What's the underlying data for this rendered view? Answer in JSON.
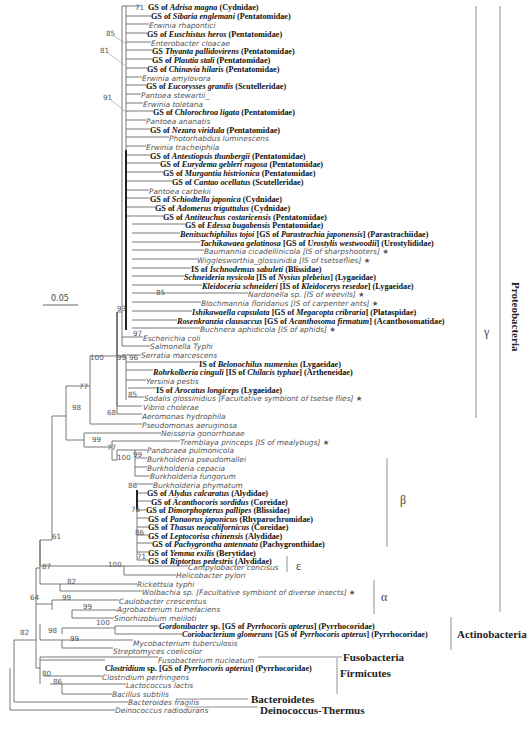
{
  "figure": {
    "scale_bar": "0.05",
    "groups": [
      {
        "id": "gamma",
        "label": "γ",
        "x": 484,
        "y": 325,
        "line": {
          "x": 476,
          "y1": 6,
          "y2": 418
        },
        "style": "greek"
      },
      {
        "id": "proteobacteria",
        "label": "Proteobacteria",
        "x": 510,
        "y": 282,
        "line": {
          "x": 500,
          "y1": 6,
          "y2": 612
        },
        "style": "vert"
      },
      {
        "id": "beta",
        "label": "β",
        "x": 400,
        "y": 493,
        "line": {
          "x": 387,
          "y1": 458,
          "y2": 547
        },
        "style": "greek"
      },
      {
        "id": "epsilon",
        "label": "ε",
        "x": 296,
        "y": 559,
        "line": {
          "x": 287,
          "y1": 556,
          "y2": 572
        },
        "style": "greek"
      },
      {
        "id": "alpha",
        "label": "α",
        "x": 381,
        "y": 590,
        "line": {
          "x": 374,
          "y1": 580,
          "y2": 614
        },
        "style": "greek"
      },
      {
        "id": "actinobacteria",
        "label": "Actinobacteria",
        "x": 457,
        "y": 628,
        "line": {
          "x": 451,
          "y1": 617,
          "y2": 650
        },
        "style": "big"
      },
      {
        "id": "fusobacteria",
        "label": "Fusobacteria",
        "x": 343,
        "y": 651,
        "style": "big"
      },
      {
        "id": "firmicutes",
        "label": "Firmicutes",
        "x": 340,
        "y": 667,
        "line": {
          "x": 337,
          "y1": 658,
          "y2": 694
        },
        "style": "big"
      },
      {
        "id": "bacteroidetes",
        "label": "Bacteroidetes",
        "x": 251,
        "y": 693,
        "style": "big"
      },
      {
        "id": "deinococcus",
        "label": "Deinococcus-Thermus",
        "x": 260,
        "y": 704,
        "style": "big"
      }
    ],
    "leaves": [
      {
        "t": "sym",
        "x": 148,
        "y": 4,
        "parts": [
          "GS of ",
          "Adrisa magna",
          " (Cydnidae)"
        ]
      },
      {
        "t": "sym",
        "x": 151,
        "y": 13,
        "parts": [
          "GS of ",
          "Sibaria englemani",
          " (Pentatomidae)"
        ]
      },
      {
        "t": "ref",
        "x": 149,
        "y": 22,
        "text": "Erwinia rhapontici"
      },
      {
        "t": "sym",
        "x": 147,
        "y": 31,
        "parts": [
          "GS of ",
          "Euschistus heros",
          " (Pentatomidae)"
        ]
      },
      {
        "t": "ref",
        "x": 151,
        "y": 40,
        "text": "Enterobacter cloacae"
      },
      {
        "t": "sym",
        "x": 152,
        "y": 48,
        "parts": [
          "GS ",
          "Thyanta pallidovirens",
          " (Pentatomidae)"
        ]
      },
      {
        "t": "sym",
        "x": 152,
        "y": 57,
        "parts": [
          "GS of ",
          "Plautia stali",
          " (Pentatomidae)"
        ]
      },
      {
        "t": "sym",
        "x": 147,
        "y": 66,
        "parts": [
          "GS of ",
          "Chinavia hilaris",
          " (Pentatomidae)"
        ]
      },
      {
        "t": "ref",
        "x": 142,
        "y": 75,
        "text": "Erwinia amylovora"
      },
      {
        "t": "sym",
        "x": 146,
        "y": 83,
        "parts": [
          "GS of ",
          "Eucorysses grandis",
          " (Scutelleridae)"
        ]
      },
      {
        "t": "ref",
        "x": 141,
        "y": 92,
        "text": "Pantoea stewartii_"
      },
      {
        "t": "ref",
        "x": 143,
        "y": 101,
        "text": "Erwinia toletana"
      },
      {
        "t": "sym",
        "x": 153,
        "y": 109,
        "parts": [
          "GS of ",
          "Chlorochroa ligata",
          " (Pentatomidae)"
        ]
      },
      {
        "t": "ref",
        "x": 146,
        "y": 118,
        "text": "Pantoea ananatis"
      },
      {
        "t": "sym",
        "x": 150,
        "y": 127,
        "parts": [
          "GS of ",
          "Nezara viridula",
          " (Pentatomidae)"
        ]
      },
      {
        "t": "ref",
        "x": 169,
        "y": 135,
        "text": "Photorhabdus luminescens"
      },
      {
        "t": "ref",
        "x": 146,
        "y": 144,
        "text": "Erwinia tracheiphila"
      },
      {
        "t": "sym",
        "x": 150,
        "y": 153,
        "parts": [
          "GS of ",
          "Antestiopsis thunbergii",
          " (Pentatomidae)"
        ]
      },
      {
        "t": "sym",
        "x": 160,
        "y": 161,
        "parts": [
          "GS of ",
          "Eurydema gebleri rugosa",
          " (Pentatomidae)"
        ]
      },
      {
        "t": "sym",
        "x": 163,
        "y": 170,
        "parts": [
          "GS of ",
          "Murgantia histrionica",
          " (Pentatomidae)"
        ]
      },
      {
        "t": "sym",
        "x": 172,
        "y": 179,
        "parts": [
          "GS of ",
          "Cantao ocellatus",
          " (Scutelleridae)"
        ]
      },
      {
        "t": "ref",
        "x": 149,
        "y": 188,
        "text": "Pantoea carbekii"
      },
      {
        "t": "sym",
        "x": 150,
        "y": 196,
        "parts": [
          "GS of ",
          "Schiodtella japonica",
          " (Cydnidae)"
        ]
      },
      {
        "t": "sym",
        "x": 155,
        "y": 205,
        "parts": [
          "GS of ",
          "Adomerus triguttulus",
          " (Cydnidae)"
        ]
      },
      {
        "t": "sym",
        "x": 163,
        "y": 214,
        "parts": [
          "GS of ",
          "Antiteuchus costaricensis",
          " (Pentatomidae)"
        ]
      },
      {
        "t": "sym",
        "x": 185,
        "y": 222,
        "parts": [
          "GS of ",
          "Edessa bugabensis",
          " Pentatomidae)"
        ]
      },
      {
        "t": "sym",
        "x": 180,
        "y": 231,
        "parts": [
          "",
          "Benitsuchiphilus tojoi",
          " [GS of ",
          "Parastrachia japonensis",
          "] (Parastrachiidae)"
        ]
      },
      {
        "t": "sym",
        "x": 200,
        "y": 240,
        "parts": [
          "",
          "Tachikawaea gelatinosa",
          " [GS of ",
          "Urostylis westwoodii",
          "] (Urostylididae)"
        ]
      },
      {
        "t": "ref",
        "x": 204,
        "y": 248,
        "text": "Baumannia cicadellinicola [IS of sharpshooters] ★"
      },
      {
        "t": "ref",
        "x": 197,
        "y": 257,
        "text": "Wigglesworthia_glossinidia [IS of tsetseflies] ★"
      },
      {
        "t": "sym",
        "x": 191,
        "y": 266,
        "parts": [
          "IS of ",
          "Ischnodemus sabuleti",
          " (Blissidae)"
        ]
      },
      {
        "t": "sym",
        "x": 184,
        "y": 274,
        "parts": [
          "",
          "Schneideria nysicola",
          " [IS of ",
          "Nysius plebeius",
          "] (Lygaeidae)"
        ]
      },
      {
        "t": "sym",
        "x": 202,
        "y": 283,
        "parts": [
          "",
          "Kleidoceria schneideri",
          " [IS of ",
          "Kleidocerys resedae",
          "] (Lygaeidae)"
        ]
      },
      {
        "t": "ref",
        "x": 248,
        "y": 291,
        "text": "Nardonella sp. [IS of weevils] ★"
      },
      {
        "t": "ref",
        "x": 201,
        "y": 300,
        "text": "Blochmannia floridanus [IS of carpenter ants] ★"
      },
      {
        "t": "sym",
        "x": 192,
        "y": 309,
        "parts": [
          "",
          "Ishikawaella capsulata",
          " [GS of ",
          "Megacopta cribraria",
          "] (Plataspidae)"
        ]
      },
      {
        "t": "sym",
        "x": 177,
        "y": 318,
        "parts": [
          "",
          "Rosenkranzia clausaccus",
          " [GS of ",
          "Acanthosoma firmatum",
          "] (Acanthosomatidae)"
        ]
      },
      {
        "t": "ref",
        "x": 200,
        "y": 326,
        "text": "Buchnera aphidicola [IS of aphids] ★"
      },
      {
        "t": "ref",
        "x": 143,
        "y": 335,
        "text": "Escherichia coli"
      },
      {
        "t": "ref",
        "x": 150,
        "y": 343,
        "text": "Salmonella Typhi"
      },
      {
        "t": "ref",
        "x": 141,
        "y": 352,
        "text": "Serratia marcescens"
      },
      {
        "t": "sym",
        "x": 199,
        "y": 361,
        "parts": [
          "IS of ",
          "Belonochilus numenius",
          " (Lygaeidae)"
        ]
      },
      {
        "t": "sym",
        "x": 153,
        "y": 369,
        "parts": [
          "",
          "Rohrkolberia cinguli",
          " [IS of ",
          "Chilacis typhae",
          "] (Artheneidae)"
        ]
      },
      {
        "t": "ref",
        "x": 146,
        "y": 378,
        "text": "Yersinia pestis"
      },
      {
        "t": "sym",
        "x": 156,
        "y": 387,
        "parts": [
          "IS of ",
          "Arocatus longiceps",
          " (Lygaeidae)"
        ]
      },
      {
        "t": "ref",
        "x": 144,
        "y": 395,
        "text": "Sodalis glossinidius [Facultative symbiont of tsetse flies] ★"
      },
      {
        "t": "ref",
        "x": 143,
        "y": 404,
        "text": "Vibrio cholerae"
      },
      {
        "t": "ref",
        "x": 142,
        "y": 413,
        "text": "Aeromonas hydrophila"
      },
      {
        "t": "ref",
        "x": 142,
        "y": 422,
        "text": "Pseudomonas aeruginosa"
      },
      {
        "t": "ref",
        "x": 161,
        "y": 430,
        "text": "Neisseria gonorrhoeae"
      },
      {
        "t": "ref",
        "x": 180,
        "y": 439,
        "text": "Tremblaya princeps [IS of mealybugs] ★"
      },
      {
        "t": "ref",
        "x": 147,
        "y": 447,
        "text": "Pandoraea pulmonicola"
      },
      {
        "t": "ref",
        "x": 147,
        "y": 456,
        "text": "Burkholderia pseudomallei"
      },
      {
        "t": "ref",
        "x": 147,
        "y": 465,
        "text": "Burkholderia cepacia"
      },
      {
        "t": "ref",
        "x": 150,
        "y": 473,
        "text": "Burkholderia fungorum"
      },
      {
        "t": "ref",
        "x": 153,
        "y": 482,
        "text": "Burkholderia phymatum"
      },
      {
        "t": "sym",
        "x": 147,
        "y": 490,
        "parts": [
          "GS of ",
          "Alydus calcaratus",
          " (Alydidae)"
        ]
      },
      {
        "t": "sym",
        "x": 151,
        "y": 499,
        "parts": [
          "GS of ",
          "Acanthocoris sordidus",
          " (Coreidae)"
        ]
      },
      {
        "t": "sym",
        "x": 146,
        "y": 507,
        "parts": [
          "GS of ",
          "Dimorphopterus pallipes",
          " (Blissidae)"
        ]
      },
      {
        "t": "sym",
        "x": 148,
        "y": 516,
        "parts": [
          "GS of ",
          "Panaorus japonicus",
          " (Rhyparochromidae)"
        ]
      },
      {
        "t": "sym",
        "x": 148,
        "y": 524,
        "parts": [
          "GS of ",
          "Thasus neocalifornicus",
          " (Coreidae)"
        ]
      },
      {
        "t": "sym",
        "x": 148,
        "y": 533,
        "parts": [
          "GS of ",
          "Leptocorisa chinensis",
          " (Alydidae)"
        ]
      },
      {
        "t": "sym",
        "x": 152,
        "y": 541,
        "parts": [
          "GS of ",
          "Pachygrontha antennata",
          " (Pachygronthidae)"
        ]
      },
      {
        "t": "sym",
        "x": 148,
        "y": 550,
        "parts": [
          "GS of ",
          "Yemma exilis",
          " (Berytidae)"
        ]
      },
      {
        "t": "sym",
        "x": 148,
        "y": 558,
        "parts": [
          "GS of ",
          "Riptortus pedestris",
          " (Alydidae)"
        ]
      },
      {
        "t": "ref",
        "x": 188,
        "y": 564,
        "text": "Campylobacter concisus"
      },
      {
        "t": "ref",
        "x": 176,
        "y": 572,
        "text": "Helicobacter pylori"
      },
      {
        "t": "ref",
        "x": 137,
        "y": 581,
        "text": "Rickettsia typhi"
      },
      {
        "t": "ref",
        "x": 142,
        "y": 589,
        "text": "Wolbachia sp. [Facultative symbiont of diverse insects] ★"
      },
      {
        "t": "ref",
        "x": 119,
        "y": 598,
        "text": "Caulobacter crescentus"
      },
      {
        "t": "ref",
        "x": 117,
        "y": 606,
        "text": "Agrobacterium tumefaciens"
      },
      {
        "t": "ref",
        "x": 114,
        "y": 615,
        "text": "Sinorhizobium meliloti"
      },
      {
        "t": "sym",
        "x": 159,
        "y": 623,
        "parts": [
          "",
          "Gordonibacter",
          " sp. [GS of ",
          "Pyrrhocoris apterus",
          "] (Pyrrhocoridae)"
        ]
      },
      {
        "t": "sym",
        "x": 182,
        "y": 631,
        "parts": [
          "",
          "Coriobacterium glomerans",
          " [GS of ",
          "Pyrrhocoris apterus",
          "] (Pyrrhocoridae)"
        ]
      },
      {
        "t": "ref",
        "x": 133,
        "y": 640,
        "text": "Mycobacterium tuberculosis"
      },
      {
        "t": "ref",
        "x": 113,
        "y": 648,
        "text": "Streptomyces coelicolor"
      },
      {
        "t": "ref",
        "x": 158,
        "y": 657,
        "text": "Fusobacterium nucleatum"
      },
      {
        "t": "sym",
        "x": 105,
        "y": 665,
        "parts": [
          "",
          "Clostridium",
          " sp. [GS of ",
          "Pyrrhocoris apterus",
          "] (Pyrrhocoridae)"
        ]
      },
      {
        "t": "ref",
        "x": 102,
        "y": 674,
        "text": "Clostridium perfringens"
      },
      {
        "t": "ref",
        "x": 126,
        "y": 682,
        "text": "Lactococcus lactis"
      },
      {
        "t": "ref",
        "x": 112,
        "y": 691,
        "text": "Bacillus subtilis"
      },
      {
        "t": "ref",
        "x": 128,
        "y": 699,
        "text": "Bacteroides fragilis"
      },
      {
        "t": "ref",
        "x": 115,
        "y": 707,
        "text": "Deinococcus radiodurans"
      }
    ],
    "bootstrap": [
      {
        "v": "71",
        "x": 135,
        "y": 4
      },
      {
        "v": "85",
        "x": 106,
        "y": 30
      },
      {
        "v": "81",
        "x": 100,
        "y": 47
      },
      {
        "v": "91",
        "x": 103,
        "y": 94
      },
      {
        "v": "93",
        "x": 117,
        "y": 305
      },
      {
        "v": "97",
        "x": 133,
        "y": 330
      },
      {
        "v": "85",
        "x": 156,
        "y": 289
      },
      {
        "v": "100",
        "x": 90,
        "y": 354
      },
      {
        "v": "99",
        "x": 117,
        "y": 354
      },
      {
        "v": "96",
        "x": 129,
        "y": 354
      },
      {
        "v": "77",
        "x": 79,
        "y": 383
      },
      {
        "v": "85",
        "x": 128,
        "y": 391
      },
      {
        "v": "68",
        "x": 107,
        "y": 409
      },
      {
        "v": "98",
        "x": 72,
        "y": 404
      },
      {
        "v": "99",
        "x": 92,
        "y": 436
      },
      {
        "v": "77",
        "x": 107,
        "y": 444
      },
      {
        "v": "100",
        "x": 117,
        "y": 454
      },
      {
        "v": "99",
        "x": 133,
        "y": 451
      },
      {
        "v": "86",
        "x": 128,
        "y": 482
      },
      {
        "v": "76",
        "x": 131,
        "y": 506
      },
      {
        "v": "86",
        "x": 135,
        "y": 529
      },
      {
        "v": "71",
        "x": 137,
        "y": 553
      },
      {
        "v": "61",
        "x": 52,
        "y": 533
      },
      {
        "v": "100",
        "x": 108,
        "y": 561
      },
      {
        "v": "87",
        "x": 42,
        "y": 563
      },
      {
        "v": "82",
        "x": 67,
        "y": 578
      },
      {
        "v": "64",
        "x": 30,
        "y": 594
      },
      {
        "v": "99",
        "x": 62,
        "y": 594
      },
      {
        "v": "99",
        "x": 83,
        "y": 603
      },
      {
        "v": "100",
        "x": 96,
        "y": 619
      },
      {
        "v": "98",
        "x": 48,
        "y": 627
      },
      {
        "v": "99",
        "x": 70,
        "y": 635
      },
      {
        "v": "82",
        "x": 20,
        "y": 629
      },
      {
        "v": "80",
        "x": 42,
        "y": 670
      },
      {
        "v": "86",
        "x": 53,
        "y": 678
      }
    ]
  }
}
